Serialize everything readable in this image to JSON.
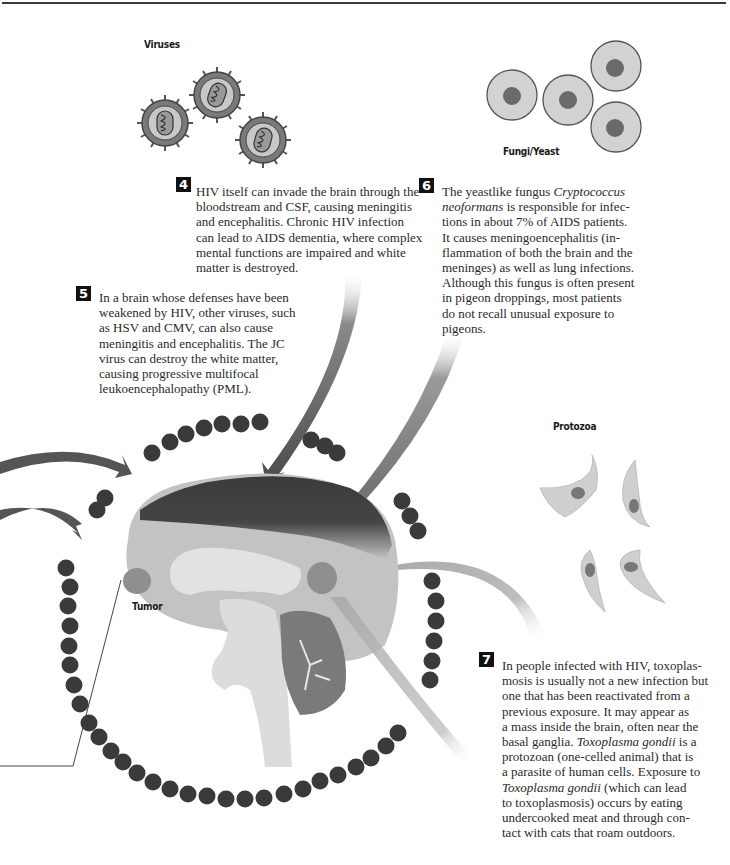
{
  "labels": {
    "viruses": "Viruses",
    "fungi": "Fungi/Yeast",
    "protozoa": "Protozoa",
    "tumor": "Tumor"
  },
  "colors": {
    "dot": "#3a3a3a",
    "brain_cortex_dark": "#3d3d3d",
    "brain_light": "#c4c4c4",
    "arrow_dark": "#555555",
    "arrow_light": "#b5b5b5"
  },
  "callouts": [
    {
      "number": "4",
      "lines": [
        "HIV itself can invade the brain through the",
        "bloodstream and CSF, causing meningitis",
        "and encephalitis. Chronic HIV infection",
        "can lead to AIDS dementia, where complex",
        "mental functions are impaired and white",
        "matter is destroyed."
      ]
    },
    {
      "number": "5",
      "lines": [
        "In a brain whose defenses have been",
        "weakened by HIV, other viruses, such",
        "as HSV and CMV, can also cause",
        "meningitis and encephalitis. The JC",
        "virus can destroy the white matter,",
        "causing progressive multifocal",
        "leukoencephalopathy (PML)."
      ]
    },
    {
      "number": "6",
      "lines": [
        "The yeastlike fungus Cryptococcus",
        "neoformans is responsible for infec-",
        "tions in about 7% of AIDS patients.",
        "It causes meningoencephalitis (in-",
        "flammation of both the brain and the",
        "meninges) as well as lung infections.",
        "Although this fungus is often present",
        "in pigeon droppings, most patients",
        "do not recall unusual exposure to",
        "pigeons."
      ]
    },
    {
      "number": "7",
      "lines": [
        "In people infected with HIV, toxoplas-",
        "mosis is usually not a new infection but",
        "one that has been reactivated from a",
        "previous exposure. It may appear as",
        "a mass inside the brain, often near the",
        "basal ganglia. Toxoplasma gondii is a",
        "protozoan (one-celled animal) that is",
        "a parasite of human cells. Exposure to",
        "Toxoplasma gondii (which can lead",
        "to toxoplasmosis) occurs by eating",
        "undercooked meat and through con-",
        "tact with cats that roam outdoors."
      ]
    }
  ]
}
